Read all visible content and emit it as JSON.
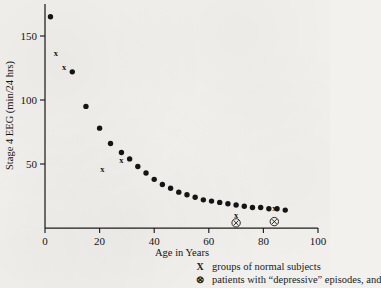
{
  "figure": {
    "kind": "scatter-plot",
    "y_axis_title": "Stage 4 EEG (min/24 hrs)",
    "x_axis_title": "Age in Years"
  },
  "legend": {
    "items": [
      {
        "symbol": "X",
        "symbol_name": "x-marker",
        "label": "groups of normal subjects"
      },
      {
        "symbol": "⊗",
        "symbol_name": "circled-x-marker",
        "label": "patients with “depressive” episodes, and"
      }
    ]
  },
  "chart_data": {
    "type": "scatter",
    "title": "",
    "xlabel": "Age in Years",
    "ylabel": "Stage 4 EEG (min/24 hrs)",
    "xlim": [
      0,
      100
    ],
    "ylim": [
      0,
      175
    ],
    "xticks": [
      0,
      20,
      40,
      60,
      80,
      100
    ],
    "xticklabels": [
      "0",
      "20",
      "40",
      "60",
      "80",
      "100"
    ],
    "yticks": [
      50,
      100,
      150
    ],
    "yticklabels": [
      "50",
      "100",
      "150"
    ],
    "grid": false,
    "legend_position": "below-axes-right",
    "series": [
      {
        "name": "individual values",
        "marker": "filled-circle",
        "x": [
          2,
          10,
          15,
          20,
          24,
          28,
          31,
          34,
          37,
          40,
          43,
          46,
          49,
          52,
          55,
          58,
          61,
          64,
          67,
          70,
          73,
          76,
          79,
          82,
          85,
          88
        ],
        "y": [
          165,
          122,
          95,
          78,
          66,
          59,
          54,
          48,
          43,
          38,
          34,
          31,
          28,
          26,
          24,
          22,
          21,
          20,
          19,
          18,
          17,
          16,
          16,
          15,
          15,
          14
        ]
      },
      {
        "name": "groups of normal subjects",
        "marker": "x",
        "x": [
          4,
          7,
          21,
          28,
          70,
          84
        ],
        "y": [
          137,
          126,
          46,
          53,
          10,
          16
        ]
      },
      {
        "name": "patients with depressive episodes",
        "marker": "circled-x",
        "x": [
          70,
          84
        ],
        "y": [
          4,
          5
        ]
      }
    ]
  }
}
